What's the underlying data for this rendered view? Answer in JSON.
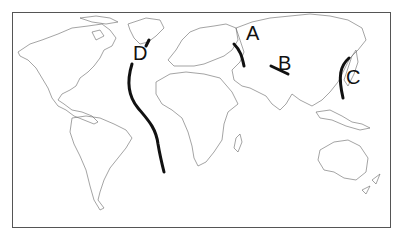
{
  "title_fragment": "",
  "map": {
    "type": "world-outline",
    "labels": {
      "A": "A",
      "B": "B",
      "C": "C",
      "D": "D"
    },
    "features": [
      {
        "label": "A",
        "description": "curved line west of Ural region (Eurasia)"
      },
      {
        "label": "B",
        "description": "short line in Central Asia"
      },
      {
        "label": "C",
        "description": "curved line along East Asian coast / Japan"
      },
      {
        "label": "D",
        "description": "long curved line through mid-Atlantic Ocean"
      }
    ]
  }
}
